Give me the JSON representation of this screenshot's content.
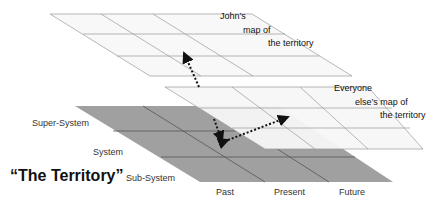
{
  "diagram": {
    "title": "“The Territory”",
    "layers": [
      {
        "id": "johns-map",
        "label_lines": [
          "John’s",
          "map of",
          "the territory"
        ],
        "fill": "#fafafa",
        "stroke": "#8a8a8a",
        "cols": 3,
        "rows": 3
      },
      {
        "id": "everyone-else-map",
        "label_lines": [
          "Everyone",
          "else’s map of",
          "the territory"
        ],
        "fill": "#fbfbfb",
        "stroke": "#8a8a8a",
        "cols": 3,
        "rows": 3
      },
      {
        "id": "territory",
        "fill": "#9c9c9c",
        "stroke": "#555555",
        "cols": 3,
        "rows": 3
      }
    ],
    "row_labels": [
      "Super-System",
      "System",
      "Sub-System"
    ],
    "col_labels": [
      "Past",
      "Present",
      "Future"
    ],
    "arrows": [
      {
        "from": "everyone-else-map",
        "to": "johns-map",
        "style": "dotted",
        "direction": "up"
      },
      {
        "from": "everyone-else-map",
        "to": "territory",
        "style": "dotted",
        "direction": "down"
      },
      {
        "from": "territory",
        "to": "everyone-else-map",
        "style": "dotted",
        "direction": "bidirectional"
      }
    ]
  }
}
